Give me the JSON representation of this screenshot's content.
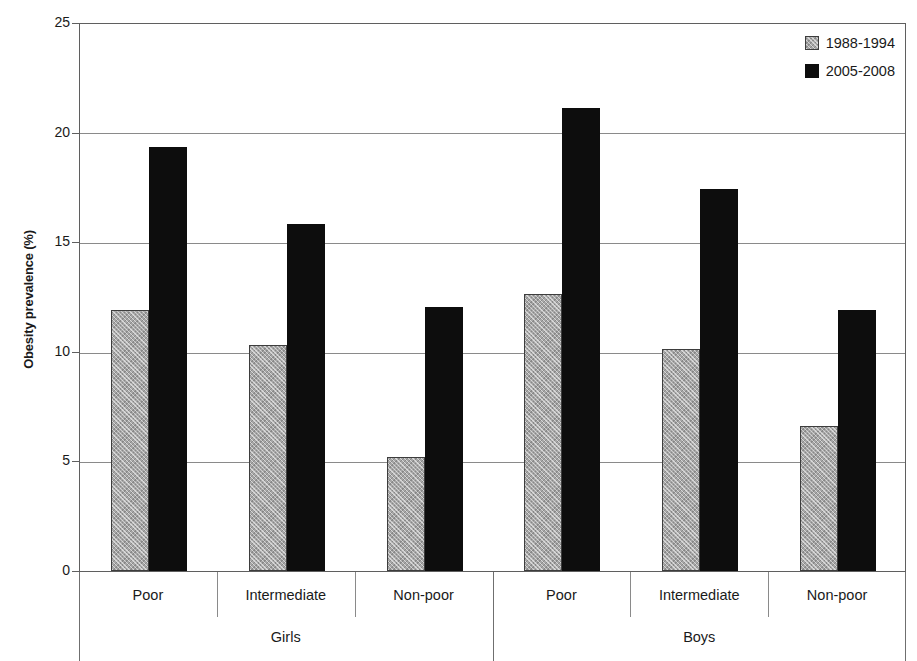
{
  "chart_data": {
    "type": "bar",
    "title": "",
    "xlabel": "",
    "ylabel": "Obesity prevalence (%)",
    "ylim": [
      0,
      25
    ],
    "yticks": [
      0,
      5,
      10,
      15,
      20,
      25
    ],
    "ytick_labels": [
      "0",
      "5",
      "10",
      "15",
      "20",
      "25"
    ],
    "grid": true,
    "legend_position": "top-right",
    "groups": [
      "Girls",
      "Boys"
    ],
    "categories": [
      "Poor",
      "Intermediate",
      "Non-poor",
      "Poor",
      "Intermediate",
      "Non-poor"
    ],
    "series": [
      {
        "name": "1988-1994",
        "color": "#a6a6a6",
        "pattern": "hatched",
        "values": [
          11.9,
          10.3,
          5.2,
          12.6,
          10.1,
          6.6
        ]
      },
      {
        "name": "2005-2008",
        "color": "#0d0d0d",
        "pattern": "solid",
        "values": [
          19.3,
          15.8,
          12.0,
          21.1,
          17.4,
          11.9
        ]
      }
    ],
    "group_spans": [
      {
        "label": "Girls",
        "categories": [
          "Poor",
          "Intermediate",
          "Non-poor"
        ]
      },
      {
        "label": "Boys",
        "categories": [
          "Poor",
          "Intermediate",
          "Non-poor"
        ]
      }
    ]
  },
  "legend": {
    "items": [
      {
        "label": "1988-1994",
        "swatch": "hatched-gray-swatch"
      },
      {
        "label": "2005-2008",
        "swatch": "solid-black-swatch"
      }
    ]
  },
  "axis": {
    "y_title": "Obesity prevalence (%)",
    "y_tick_0": "0",
    "y_tick_1": "5",
    "y_tick_2": "10",
    "y_tick_3": "15",
    "y_tick_4": "20",
    "y_tick_5": "25"
  },
  "xaxis": {
    "categories": [
      "Poor",
      "Intermediate",
      "Non-poor",
      "Poor",
      "Intermediate",
      "Non-poor"
    ],
    "groups": [
      "Girls",
      "Boys"
    ]
  }
}
